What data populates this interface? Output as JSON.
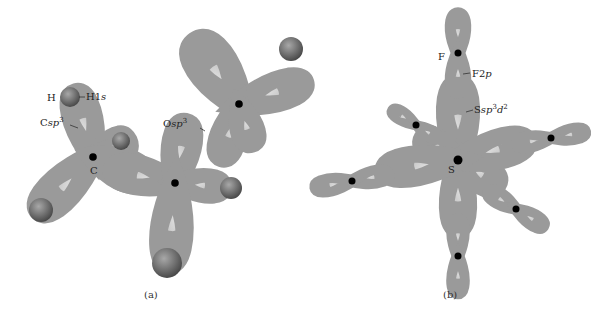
{
  "figure": {
    "panels": [
      {
        "id": "a",
        "caption": "(a)",
        "labels": {
          "h_atom": "H",
          "h_orbital_prefix": "H1",
          "h_orbital_italic": "s",
          "c_orbital_prefix": "C",
          "c_orbital_italic": "sp",
          "c_orbital_sup": "3",
          "c_atom": "C",
          "o_orbital_prefix": "O",
          "o_orbital_italic": "sp",
          "o_orbital_sup": "3"
        }
      },
      {
        "id": "b",
        "caption": "(b)",
        "labels": {
          "f_atom": "F",
          "f_orbital_prefix": "F2",
          "f_orbital_italic": "p",
          "s_orbital_prefix": "S",
          "s_orbital_italic": "sp",
          "s_orbital_sup1": "3",
          "s_orbital_italic2": "d",
          "s_orbital_sup2": "2",
          "s_atom": "S"
        }
      }
    ],
    "colors": {
      "lobe": "#c4c4c4",
      "lobe_edge": "#8c8c8c",
      "sphere": "#6e6e6e",
      "nucleus": "#000000"
    }
  }
}
